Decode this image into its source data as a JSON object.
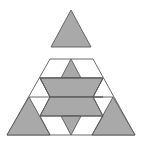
{
  "figure": {
    "colors": {
      "shaded": "#a9a9a9",
      "outline": "#5a5a5a",
      "background": "#ffffff"
    },
    "pieces": [
      {
        "name": "top-triangle",
        "type": "triangle",
        "shaded": true
      },
      {
        "name": "center-top-triangle",
        "type": "triangle",
        "shaded": true
      },
      {
        "name": "upper-band",
        "type": "hexagon",
        "shaded": true
      },
      {
        "name": "lower-band",
        "type": "hexagon",
        "shaded": true
      },
      {
        "name": "center-bottom-triangle",
        "type": "triangle",
        "shaded": true
      },
      {
        "name": "bottom-left-triangle",
        "type": "triangle",
        "shaded": true
      },
      {
        "name": "bottom-right-triangle",
        "type": "triangle",
        "shaded": true
      }
    ]
  }
}
